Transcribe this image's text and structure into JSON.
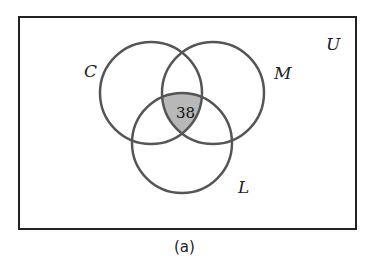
{
  "diagram": {
    "type": "venn",
    "universe_label": "U",
    "sets": [
      {
        "name": "C",
        "label": "C"
      },
      {
        "name": "M",
        "label": "M"
      },
      {
        "name": "L",
        "label": "L"
      }
    ],
    "regions": [
      {
        "region": "C∩M∩L",
        "value": "38",
        "shaded": true,
        "shade_color": "#b8b8b8"
      }
    ],
    "caption": "(a)",
    "colors": {
      "outline": "#555555",
      "frame": "#222222",
      "shade": "#b8b8b8"
    }
  }
}
